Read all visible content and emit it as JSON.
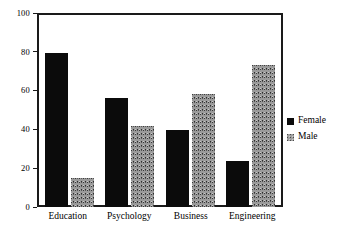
{
  "chart_data": {
    "type": "bar",
    "title": "",
    "subtitle": "",
    "xlabel": "",
    "ylabel": "",
    "categories": [
      "Education",
      "Psychology",
      "Business",
      "Engineering"
    ],
    "series": [
      {
        "name": "Female",
        "color": "#0b0b0b",
        "values": [
          80,
          57,
          40,
          24
        ]
      },
      {
        "name": "Male",
        "color": "#9a9a9a",
        "values": [
          15,
          42,
          59,
          74
        ]
      }
    ],
    "ylim": [
      0,
      100
    ],
    "yticks": [
      0,
      20,
      40,
      60,
      80,
      100
    ],
    "ytick_labels": [
      "0",
      "20",
      "40",
      "60",
      "80",
      "100"
    ],
    "grid": false,
    "legend_position": "right",
    "annotations": []
  },
  "legend": {
    "items": [
      {
        "label": "Female",
        "swatch": "female-swatch"
      },
      {
        "label": "Male",
        "swatch": "male-swatch"
      }
    ]
  }
}
